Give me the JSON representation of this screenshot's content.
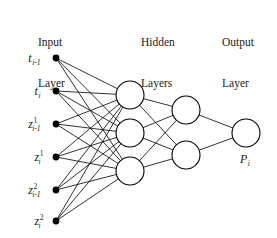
{
  "figure": {
    "background_color": "#ffffff",
    "stroke_color": "#000000",
    "input_node_fill": "#000000",
    "hidden_node_fill": "#ffffff"
  },
  "headings": {
    "input": {
      "line1": "Input",
      "line2": "Layer"
    },
    "hidden": {
      "line1": "Hidden",
      "line2": "Layers"
    },
    "output": {
      "line1": "Output",
      "line2": "Layer"
    }
  },
  "input_labels": [
    {
      "base": "t",
      "sup": "",
      "sub": "i-1"
    },
    {
      "base": "t",
      "sup": "",
      "sub": "i"
    },
    {
      "base": "z",
      "sup": "1",
      "sub": "i-1"
    },
    {
      "base": "z",
      "sup": "1",
      "sub": "i"
    },
    {
      "base": "z",
      "sup": "2",
      "sub": "i-1"
    },
    {
      "base": "z",
      "sup": "2",
      "sub": "i"
    }
  ],
  "output_label": {
    "base": "P",
    "sub": "i"
  },
  "chart_data": {
    "type": "diagram",
    "diagram_kind": "neural-network",
    "fully_connected": true,
    "layers": [
      {
        "name": "Input Layer",
        "kind": "input",
        "count": 6,
        "node_style": "filled-dot",
        "radius": 3.4,
        "x": 56,
        "nodes": [
          {
            "label": "t_{i-1}",
            "x": 56,
            "y": 58
          },
          {
            "label": "t_{i}",
            "x": 56,
            "y": 91
          },
          {
            "label": "z^{1}_{i-1}",
            "x": 56,
            "y": 124
          },
          {
            "label": "z^{1}_{i}",
            "x": 56,
            "y": 157
          },
          {
            "label": "z^{2}_{i-1}",
            "x": 56,
            "y": 190
          },
          {
            "label": "z^{2}_{i}",
            "x": 56,
            "y": 221
          }
        ]
      },
      {
        "name": "Hidden Layer 1",
        "kind": "hidden",
        "count": 3,
        "node_style": "hollow-circle",
        "radius": 14,
        "x": 130,
        "nodes": [
          {
            "label": "",
            "x": 130,
            "y": 95
          },
          {
            "label": "",
            "x": 130,
            "y": 133
          },
          {
            "label": "",
            "x": 130,
            "y": 171
          }
        ]
      },
      {
        "name": "Hidden Layer 2",
        "kind": "hidden",
        "count": 2,
        "node_style": "hollow-circle",
        "radius": 14,
        "x": 186,
        "nodes": [
          {
            "label": "",
            "x": 186,
            "y": 110
          },
          {
            "label": "",
            "x": 186,
            "y": 155
          }
        ]
      },
      {
        "name": "Output Layer",
        "kind": "output",
        "count": 1,
        "node_style": "hollow-circle",
        "radius": 14,
        "x": 246,
        "nodes": [
          {
            "label": "P_{i}",
            "x": 246,
            "y": 133
          }
        ]
      }
    ],
    "edge_counts": {
      "input_to_hidden1": 18,
      "hidden1_to_hidden2": 6,
      "hidden2_to_output": 2
    },
    "total_edges": 26
  }
}
